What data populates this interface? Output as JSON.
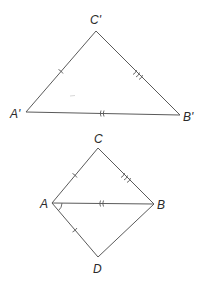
{
  "diagram": {
    "type": "congruent-triangles",
    "colors": {
      "line": "#5a5a5a",
      "text": "#2a2a2a",
      "background": "#ffffff"
    },
    "figures": [
      {
        "id": "top-triangle",
        "vertices": [
          {
            "label": "C'",
            "x": 96,
            "y": 31,
            "label_x": 90,
            "label_y": 24
          },
          {
            "label": "A'",
            "x": 26,
            "y": 112,
            "label_x": 10,
            "label_y": 118
          },
          {
            "label": "B'",
            "x": 180,
            "y": 115,
            "label_x": 183,
            "label_y": 121
          }
        ],
        "segments": [
          {
            "from": "A'",
            "to": "C'",
            "tick_marks": 1
          },
          {
            "from": "C'",
            "to": "B'",
            "tick_marks": 3
          },
          {
            "from": "A'",
            "to": "B'",
            "tick_marks": 2
          }
        ]
      },
      {
        "id": "bottom-quadrilateral",
        "vertices": [
          {
            "label": "C",
            "x": 98,
            "y": 148,
            "label_x": 94,
            "label_y": 143
          },
          {
            "label": "A",
            "x": 52,
            "y": 203,
            "label_x": 40,
            "label_y": 208
          },
          {
            "label": "B",
            "x": 154,
            "y": 204,
            "label_x": 157,
            "label_y": 209
          },
          {
            "label": "D",
            "x": 98,
            "y": 257,
            "label_x": 93,
            "label_y": 273
          }
        ],
        "segments": [
          {
            "from": "A",
            "to": "C",
            "tick_marks": 1
          },
          {
            "from": "C",
            "to": "B",
            "tick_marks": 3
          },
          {
            "from": "A",
            "to": "B",
            "tick_marks": 2
          },
          {
            "from": "A",
            "to": "D",
            "tick_marks": 1
          },
          {
            "from": "D",
            "to": "B",
            "tick_marks": 0
          }
        ],
        "angle_marks": [
          {
            "vertex": "A",
            "between": [
              "B",
              "D"
            ],
            "arcs": 1
          }
        ]
      }
    ]
  },
  "labels": {
    "c_prime": "C'",
    "a_prime": "A'",
    "b_prime": "B'",
    "c": "C",
    "a": "A",
    "b": "B",
    "d": "D"
  }
}
